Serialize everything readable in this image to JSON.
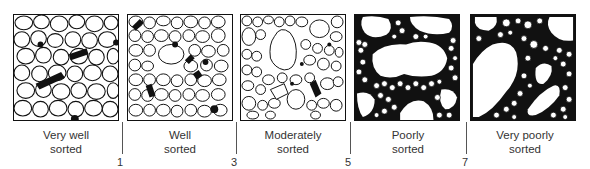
{
  "figure": {
    "panels": [
      {
        "id": "very-well",
        "line1": "Very  well",
        "line2": "sorted"
      },
      {
        "id": "well",
        "line1": "Well",
        "line2": "sorted"
      },
      {
        "id": "moderately",
        "line1": "Moderately",
        "line2": "sorted"
      },
      {
        "id": "poorly",
        "line1": "Poorly",
        "line2": "sorted"
      },
      {
        "id": "very-poorly",
        "line1": "Very  poorly",
        "line2": "sorted"
      }
    ],
    "boundaries": [
      "1",
      "3",
      "5",
      "7"
    ],
    "colors": {
      "grain_fill": "#ffffff",
      "matrix": "#111111",
      "outline": "#111111"
    }
  }
}
